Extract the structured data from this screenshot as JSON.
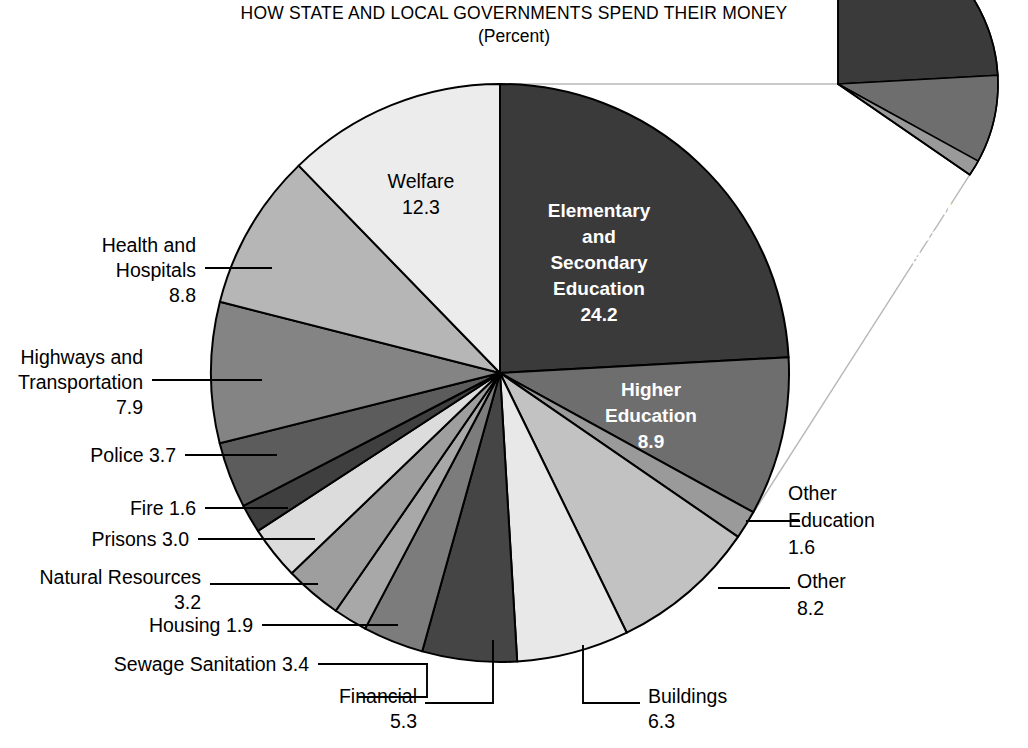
{
  "title": {
    "line1": "HOW STATE AND LOCAL GOVERNMENTS SPEND THEIR MONEY",
    "line2": "(Percent)"
  },
  "chart_data": {
    "type": "pie",
    "title": "HOW STATE AND LOCAL GOVERNMENTS SPEND THEIR MONEY",
    "subtitle": "(Percent)",
    "units": "percent",
    "legend": "none",
    "grid": false,
    "total": 100.0,
    "start_angle_deg": 0,
    "direction": "clockwise",
    "categories": [
      "Elementary and Secondary Education",
      "Higher Education",
      "Other Education",
      "Other",
      "Buildings",
      "Financial",
      "Sewage Sanitation",
      "Housing",
      "Natural Resources",
      "Prisons",
      "Fire",
      "Police",
      "Highways and Transportation",
      "Health and Hospitals",
      "Welfare"
    ],
    "values": [
      24.2,
      8.9,
      1.6,
      8.2,
      6.3,
      5.3,
      3.4,
      1.9,
      3.2,
      3.0,
      1.6,
      3.7,
      7.9,
      8.8,
      12.3
    ],
    "slices": [
      {
        "name": "Elementary and Secondary Education",
        "label_lines": [
          "Elementary",
          "and",
          "Secondary",
          "Education"
        ],
        "value": 24.2,
        "value_text": "24.2",
        "color": "#3a3a3a",
        "label_placement": "inside",
        "label_color": "#ffffff"
      },
      {
        "name": "Higher Education",
        "label_lines": [
          "Higher",
          "Education"
        ],
        "value": 8.9,
        "value_text": "8.9",
        "color": "#6e6e6e",
        "label_placement": "inside",
        "label_color": "#ffffff"
      },
      {
        "name": "Other Education",
        "label_lines": [
          "Other",
          "Education"
        ],
        "value": 1.6,
        "value_text": "1.6",
        "color": "#9a9a9a",
        "label_placement": "outside-right"
      },
      {
        "name": "Other",
        "label_lines": [
          "Other"
        ],
        "value": 8.2,
        "value_text": "8.2",
        "color": "#c2c2c2",
        "label_placement": "outside-right"
      },
      {
        "name": "Buildings",
        "label_lines": [
          "Buildings"
        ],
        "value": 6.3,
        "value_text": "6.3",
        "color": "#e8e8e8",
        "label_placement": "outside-bottom"
      },
      {
        "name": "Financial",
        "label_lines": [
          "Financial"
        ],
        "value": 5.3,
        "value_text": "5.3",
        "color": "#454545",
        "label_placement": "outside-bottom"
      },
      {
        "name": "Sewage Sanitation",
        "label_lines": [
          "Sewage Sanitation 3.4"
        ],
        "value": 3.4,
        "value_text": "3.4",
        "color": "#7c7c7c",
        "label_placement": "outside-left"
      },
      {
        "name": "Housing",
        "label_lines": [
          "Housing 1.9"
        ],
        "value": 1.9,
        "value_text": "1.9",
        "color": "#a8a8a8",
        "label_placement": "outside-left"
      },
      {
        "name": "Natural Resources",
        "label_lines": [
          "Natural Resources"
        ],
        "value": 3.2,
        "value_text": "3.2",
        "color": "#9e9e9e",
        "label_placement": "outside-left"
      },
      {
        "name": "Prisons",
        "label_lines": [
          "Prisons 3.0"
        ],
        "value": 3.0,
        "value_text": "3.0",
        "color": "#dcdcdc",
        "label_placement": "outside-left"
      },
      {
        "name": "Fire",
        "label_lines": [
          "Fire 1.6"
        ],
        "value": 1.6,
        "value_text": "1.6",
        "color": "#3f3f3f",
        "label_placement": "outside-left"
      },
      {
        "name": "Police",
        "label_lines": [
          "Police 3.7"
        ],
        "value": 3.7,
        "value_text": "3.7",
        "color": "#5c5c5c",
        "label_placement": "outside-left"
      },
      {
        "name": "Highways and Transportation",
        "label_lines": [
          "Highways and",
          "Transportation"
        ],
        "value": 7.9,
        "value_text": "7.9",
        "color": "#848484",
        "label_placement": "outside-left"
      },
      {
        "name": "Health and Hospitals",
        "label_lines": [
          "Health and",
          "Hospitals"
        ],
        "value": 8.8,
        "value_text": "8.8",
        "color": "#b6b6b6",
        "label_placement": "outside-left"
      },
      {
        "name": "Welfare",
        "label_lines": [
          "Welfare"
        ],
        "value": 12.3,
        "value_text": "12.3",
        "color": "#ececec",
        "label_placement": "inside",
        "label_color": "#000000"
      }
    ],
    "exploded_group": {
      "name": "Total Education",
      "label_lines": [
        "Total",
        "Education"
      ],
      "value": 34.7,
      "value_text": "34.7",
      "components": [
        {
          "name": "Elementary and Secondary Education",
          "value": 24.2,
          "color": "#3a3a3a"
        },
        {
          "name": "Higher Education",
          "value": 8.9,
          "color": "#6e6e6e"
        },
        {
          "name": "Other Education",
          "value": 1.6,
          "color": "#9a9a9a"
        }
      ]
    }
  },
  "labels": {
    "welfare": {
      "line1": "Welfare",
      "line2": "12.3"
    },
    "elem_sec": {
      "l1": "Elementary",
      "l2": "and",
      "l3": "Secondary",
      "l4": "Education",
      "l5": "24.2"
    },
    "higher_ed": {
      "l1": "Higher",
      "l2": "Education",
      "l3": "8.9"
    },
    "total_ed": {
      "l1": "Total",
      "l2": "Education",
      "l3": "34.7"
    },
    "health": {
      "l1": "Health and",
      "l2": "Hospitals",
      "l3": "8.8"
    },
    "highways": {
      "l1": "Highways and",
      "l2": "Transportation",
      "l3": "7.9"
    },
    "police": {
      "l1": "Police 3.7"
    },
    "fire": {
      "l1": "Fire 1.6"
    },
    "prisons": {
      "l1": "Prisons 3.0"
    },
    "natural": {
      "l1": "Natural Resources",
      "l2": "3.2"
    },
    "housing": {
      "l1": "Housing 1.9"
    },
    "sewage": {
      "l1": "Sewage Sanitation 3.4"
    },
    "financial": {
      "l1": "Financial",
      "l2": "5.3"
    },
    "buildings": {
      "l1": "Buildings",
      "l2": "6.3"
    },
    "other_ed": {
      "l1": "Other",
      "l2": "Education",
      "l3": "1.6"
    },
    "other": {
      "l1": "Other",
      "l2": "8.2"
    }
  }
}
